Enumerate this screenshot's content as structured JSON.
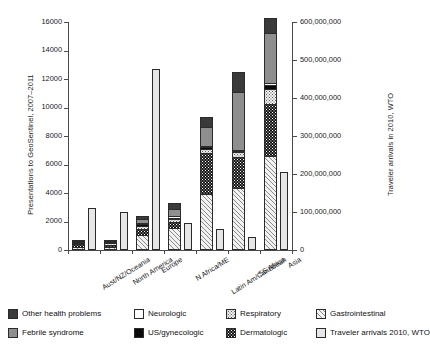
{
  "chart_data": {
    "type": "bar",
    "title": "",
    "subtitle": "",
    "stacked": true,
    "categories": [
      "Aust/NZ/Oceania",
      "North America",
      "Europe",
      "N Africa/ME",
      "Latin Am/Caribbean",
      "SS Africa",
      "Asia"
    ],
    "ylabel": "Presentations to GeoSentinel, 2007–2011",
    "ylabel_right": "Traveler arrivals in 2010, WTO",
    "xlabel": "",
    "ylim": [
      0,
      16000
    ],
    "ylim_right": [
      0,
      600000000
    ],
    "yticks": [
      0,
      2000,
      4000,
      6000,
      8000,
      10000,
      12000,
      14000,
      16000
    ],
    "yticklabels": [
      "0",
      "2000",
      "4000",
      "6000",
      "8000",
      "10000",
      "12000",
      "14000",
      "16000"
    ],
    "yticks_right": [
      0,
      100000000,
      200000000,
      300000000,
      400000000,
      500000000,
      600000000
    ],
    "yticklabels_right": [
      "0",
      "100,000,000",
      "200,000,000",
      "300,000,000",
      "400,000,000",
      "500,000,000",
      "600,000,000"
    ],
    "grid": false,
    "legend_position": "bottom",
    "series": [
      {
        "name": "Gastrointestinal",
        "key": "gi",
        "values": [
          150,
          160,
          990,
          1480,
          3880,
          4250,
          6550
        ]
      },
      {
        "name": "Dermatologic",
        "key": "derm",
        "values": [
          200,
          150,
          430,
          420,
          2850,
          2200,
          3650
        ]
      },
      {
        "name": "Respiratory",
        "key": "resp",
        "values": [
          60,
          80,
          200,
          180,
          310,
          350,
          1050
        ]
      },
      {
        "name": "US/gynecologic",
        "key": "usgyn",
        "values": [
          40,
          50,
          110,
          130,
          140,
          110,
          290
        ]
      },
      {
        "name": "Neurologic",
        "key": "neuro",
        "values": [
          30,
          40,
          70,
          90,
          70,
          70,
          110
        ]
      },
      {
        "name": "Febrile syndrome",
        "key": "febrile",
        "values": [
          100,
          110,
          300,
          510,
          1340,
          4010,
          3530
        ]
      },
      {
        "name": "Other health problems",
        "key": "other",
        "values": [
          90,
          100,
          230,
          430,
          700,
          1450,
          1040
        ]
      }
    ],
    "series_order_bottom_to_top": [
      "Gastrointestinal",
      "Dermatologic",
      "Respiratory",
      "US/gynecologic",
      "Neurologic",
      "Febrile syndrome",
      "Other health problems"
    ],
    "secondary_series": {
      "name": "Traveler arrivals 2010, WTO",
      "key": "travel",
      "axis": "right",
      "values": [
        110000000,
        101000000,
        476000000,
        71000000,
        56000000,
        34000000,
        204000000
      ]
    },
    "totals_left_axis": [
      670,
      690,
      2330,
      3240,
      9290,
      12440,
      16220
    ]
  },
  "legend": {
    "rows": [
      [
        {
          "label": "Other health problems",
          "key": "other"
        },
        {
          "label": "Neurologic",
          "key": "neuro"
        },
        {
          "label": "Respiratory",
          "key": "resp"
        },
        {
          "label": "Gastrointestinal",
          "key": "gi"
        }
      ],
      [
        {
          "label": "Febrile syndrome",
          "key": "febrile"
        },
        {
          "label": "US/gynecologic",
          "key": "usgyn"
        },
        {
          "label": "Dermatologic",
          "key": "derm"
        },
        {
          "label": "Traveler arrivals 2010, WTO",
          "key": "travel"
        }
      ]
    ]
  },
  "colors": {
    "other": "#3a3a3a",
    "febrile": "#8e8e8e",
    "neuro": "#ffffff",
    "usgyn": "#0a0a0a",
    "resp": "#f0f0f0",
    "derm": "#131313",
    "gi": "#f2f2f2",
    "travel": "#e6e6e6",
    "axis": "#4a4a4a",
    "text": "#1a1a1a"
  }
}
